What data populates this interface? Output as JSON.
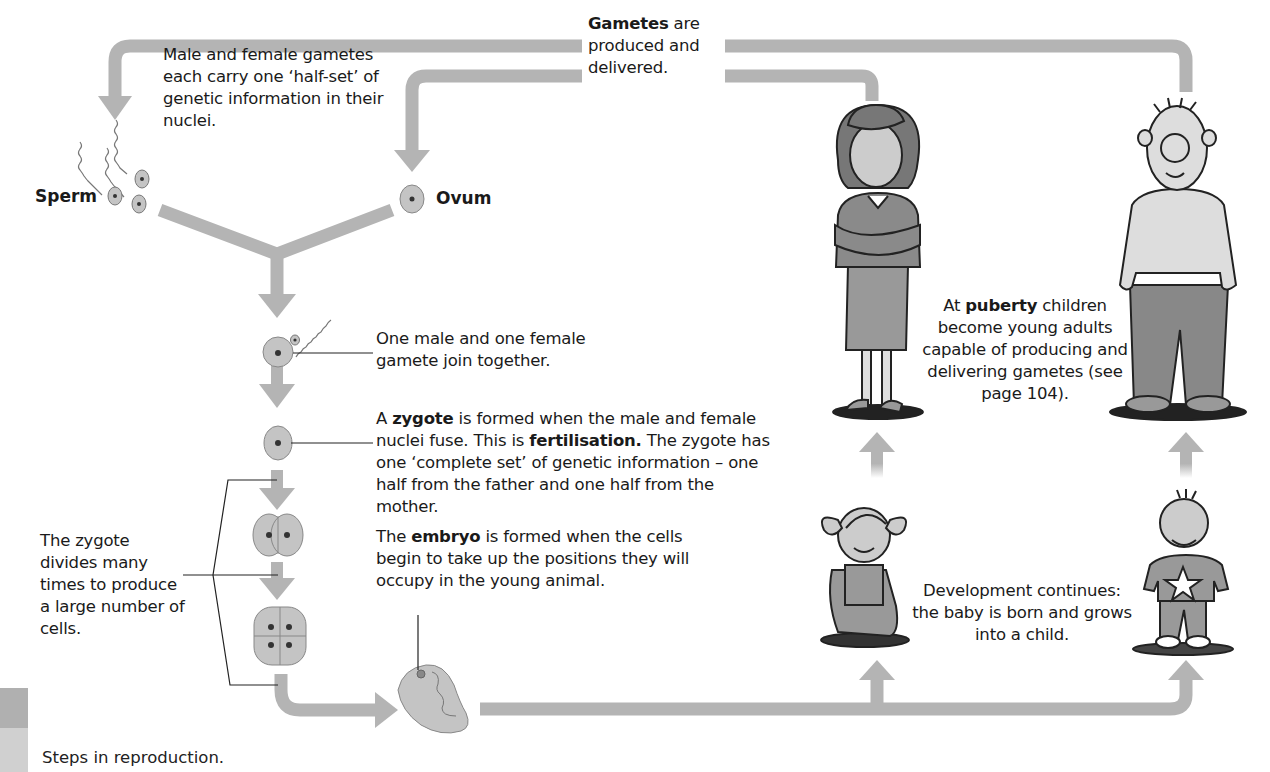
{
  "labels": {
    "sperm": "Sperm",
    "ovum": "Ovum"
  },
  "annotations": {
    "gametes_carry": "Male and female gametes each carry one ‘half-set’ of genetic information in their nuclei.",
    "gametes_produced": {
      "bold": "Gametes",
      "rest": " are produced and delivered."
    },
    "join_together": "One male and one female gamete join together.",
    "zygote": {
      "pre": "A ",
      "bold1": "zygote",
      "mid1": " is formed when the male and female nuclei fuse. This is ",
      "bold2": "fertilisation.",
      "post": " The zygote has one ‘complete set’ of genetic information – one half from the father and one half from the mother."
    },
    "divides": "The zygote divides many times to produce a large number of cells.",
    "embryo": {
      "pre": "The ",
      "bold": "embryo",
      "post": " is formed when the cells begin to take up the positions they will occupy in the young animal."
    },
    "puberty": {
      "pre": "At ",
      "bold": "puberty",
      "post": " children become young adults capable of producing and delivering gametes (see page 104)."
    },
    "development": "Development continues: the baby is born and grows into a child."
  },
  "caption": "Steps in reproduction.",
  "colors": {
    "arrow": "#b4b4b4",
    "cell_fill": "#c4c4c4",
    "cell_stroke": "#888888",
    "nucleus": "#333333",
    "caption_block_top": "#b0b0b0",
    "caption_block_bottom": "#d0d0d0"
  }
}
